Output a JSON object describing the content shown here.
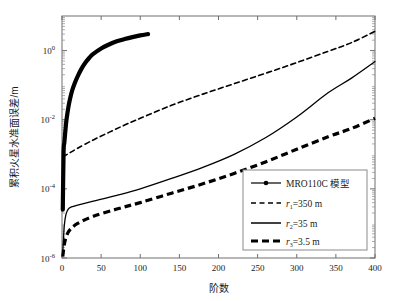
{
  "chart_data": {
    "type": "line",
    "title": "",
    "xlabel": "阶数",
    "ylabel": "累积火星水准面误差/m",
    "y_scale": "log",
    "xlim": [
      0,
      400
    ],
    "ylim": [
      1e-06,
      10
    ],
    "xticks": [
      0,
      50,
      100,
      150,
      200,
      250,
      300,
      350,
      400
    ],
    "xtick_labels": [
      "0",
      "50",
      "100",
      "150",
      "200",
      "250",
      "300",
      "350",
      "400"
    ],
    "yticks": [
      1,
      0.01,
      0.0001,
      1e-06
    ],
    "ytick_labels": [
      "10",
      "10",
      "10",
      "10"
    ],
    "ytick_exponents": [
      "0",
      "-2",
      "-4",
      "-6"
    ],
    "grid": false,
    "legend_position": "lower right",
    "series": [
      {
        "name": "MRO110C 模型",
        "style": "solid-marker",
        "color": "#000000",
        "width": 4.2,
        "x": [
          1,
          2,
          3,
          4,
          5,
          6,
          8,
          10,
          13,
          16,
          20,
          25,
          30,
          35,
          40,
          50,
          60,
          70,
          80,
          90,
          100,
          110
        ],
        "y": [
          2.5e-05,
          0.0011,
          0.0022,
          0.004,
          0.007,
          0.011,
          0.022,
          0.038,
          0.07,
          0.11,
          0.18,
          0.3,
          0.45,
          0.62,
          0.8,
          1.15,
          1.5,
          1.85,
          2.15,
          2.45,
          2.75,
          3.0
        ]
      },
      {
        "name": "r1=350 m",
        "label_base": "r",
        "label_sub": "1",
        "label_rest": "=350 m",
        "style": "dashed",
        "color": "#000000",
        "width": 1.6,
        "x": [
          1,
          5,
          10,
          20,
          40,
          60,
          80,
          100,
          140,
          180,
          220,
          260,
          300,
          340,
          370,
          400
        ],
        "y": [
          0.00085,
          0.00095,
          0.0011,
          0.0015,
          0.0026,
          0.0043,
          0.007,
          0.011,
          0.026,
          0.055,
          0.11,
          0.22,
          0.45,
          0.95,
          1.7,
          3.6
        ]
      },
      {
        "name": "r2=35 m",
        "label_base": "r",
        "label_sub": "2",
        "label_rest": "=35 m",
        "style": "solid",
        "color": "#000000",
        "width": 1.3,
        "x": [
          1,
          2,
          3,
          5,
          8,
          12,
          20,
          40,
          70,
          100,
          140,
          180,
          220,
          260,
          300,
          340,
          370,
          400
        ],
        "y": [
          1.5e-06,
          4e-06,
          9e-06,
          1.8e-05,
          2.6e-05,
          3e-05,
          3.4e-05,
          4.4e-05,
          6.5e-05,
          0.0001,
          0.0002,
          0.00042,
          0.001,
          0.003,
          0.012,
          0.06,
          0.16,
          0.48
        ]
      },
      {
        "name": "r3=3.5 m",
        "label_base": "r",
        "label_sub": "3",
        "label_rest": "=3.5 m",
        "style": "thick-dashed",
        "color": "#000000",
        "width": 3.2,
        "x": [
          1,
          3,
          6,
          10,
          20,
          40,
          70,
          100,
          140,
          180,
          220,
          260,
          300,
          340,
          370,
          400
        ],
        "y": [
          1.1e-06,
          2.5e-06,
          4.5e-06,
          6.5e-06,
          1e-05,
          1.6e-05,
          2.6e-05,
          4e-05,
          7.5e-05,
          0.00014,
          0.00028,
          0.0006,
          0.0014,
          0.0032,
          0.0056,
          0.011
        ]
      }
    ]
  },
  "legend": {
    "entries": [
      {
        "label": "MRO110C 模型"
      },
      {
        "label": "=350 m",
        "sym": "r",
        "sub": "1"
      },
      {
        "label": "=35 m",
        "sym": "r",
        "sub": "2"
      },
      {
        "label": "=3.5 m",
        "sym": "r",
        "sub": "3"
      }
    ]
  },
  "axes": {
    "x_title": "阶数",
    "y_title": "累积火星水准面误差/m"
  }
}
